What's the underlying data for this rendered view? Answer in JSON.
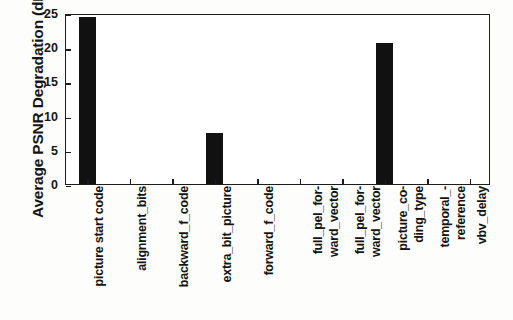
{
  "chart_data": {
    "type": "bar",
    "title": "",
    "xlabel": "",
    "ylabel": "Average PSNR Degradation (dB)",
    "categories": [
      "picture start code",
      "alignment_bits",
      "backward_f_code",
      "extra_bit_picture",
      "forward_f_code",
      "full_pel_for-\nward_vector",
      "full_pel_for-\nward_vector",
      "picture_co-\nding_type",
      "temporal_-\nreference",
      "vbv_delay"
    ],
    "values": [
      24.4,
      0,
      0,
      7.4,
      0,
      0,
      0,
      20.6,
      0,
      0
    ],
    "ylim": [
      0,
      25
    ],
    "yticks": [
      0,
      5,
      10,
      15,
      20,
      25
    ],
    "ytick_labels": [
      "0",
      "5",
      "10",
      "15",
      "20",
      "25"
    ],
    "grid": false,
    "legend": null,
    "bar_color": "#111111",
    "axis_color": "#1c1c1c"
  }
}
